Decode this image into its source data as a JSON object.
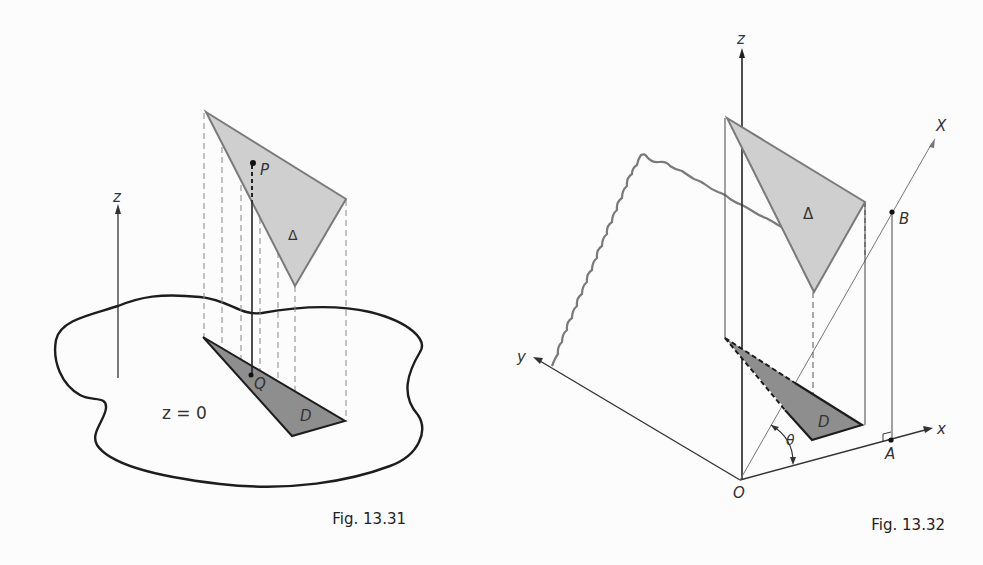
{
  "figures": [
    {
      "id": "fig-13-31",
      "caption": "Fig. 13.31",
      "labels": {
        "z_axis": "z",
        "point_P": "P",
        "point_Q": "Q",
        "surface_triangle": "Δ",
        "region_D": "D",
        "plane_equation": "z = 0"
      }
    },
    {
      "id": "fig-13-32",
      "caption": "Fig. 13.32",
      "labels": {
        "z_axis": "z",
        "x_axis": "x",
        "y_axis": "y",
        "X_axis": "X",
        "point_B": "B",
        "point_A": "A",
        "origin": "O",
        "angle": "θ",
        "surface_triangle": "Δ",
        "region_D": "D"
      }
    }
  ],
  "colors": {
    "background": "#fcfcfc",
    "ink": "#222222",
    "triangle_light": "#cfcfcf",
    "triangle_dark": "#8e8e8e",
    "plane_edge": "#7a7a7a"
  }
}
